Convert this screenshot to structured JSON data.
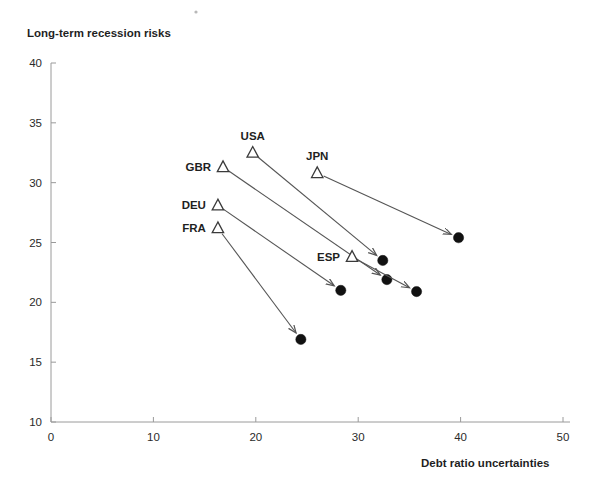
{
  "chart_data": {
    "type": "scatter",
    "title": "",
    "ylabel": "Long-term recession risks",
    "xlabel": "Debt ratio uncertainties",
    "xlim": [
      0,
      50
    ],
    "ylim": [
      10,
      40
    ],
    "xticks": [
      0,
      10,
      20,
      30,
      40,
      50
    ],
    "yticks": [
      10,
      15,
      20,
      25,
      30,
      35,
      40
    ],
    "grid": false,
    "legend": "none",
    "annotation": "Each country has an open-triangle start marker and a filled-circle end marker connected by an arrow pointing from start to end.",
    "series": [
      {
        "name": "GBR",
        "label": "GBR",
        "start": {
          "x": 16.8,
          "y": 31.3,
          "marker": "open-triangle"
        },
        "end": {
          "x": 32.8,
          "y": 21.9,
          "marker": "filled-circle"
        }
      },
      {
        "name": "USA",
        "label": "USA",
        "start": {
          "x": 19.7,
          "y": 32.5,
          "marker": "open-triangle"
        },
        "end": {
          "x": 32.4,
          "y": 23.5,
          "marker": "filled-circle"
        }
      },
      {
        "name": "JPN",
        "label": "JPN",
        "start": {
          "x": 26.0,
          "y": 30.8,
          "marker": "open-triangle"
        },
        "end": {
          "x": 39.8,
          "y": 25.4,
          "marker": "filled-circle"
        }
      },
      {
        "name": "DEU",
        "label": "DEU",
        "start": {
          "x": 16.3,
          "y": 28.1,
          "marker": "open-triangle"
        },
        "end": {
          "x": 28.3,
          "y": 21.0,
          "marker": "filled-circle"
        }
      },
      {
        "name": "FRA",
        "label": "FRA",
        "start": {
          "x": 16.3,
          "y": 26.2,
          "marker": "open-triangle"
        },
        "end": {
          "x": 24.4,
          "y": 16.9,
          "marker": "filled-circle"
        }
      },
      {
        "name": "ESP",
        "label": "ESP",
        "start": {
          "x": 29.4,
          "y": 23.8,
          "marker": "open-triangle"
        },
        "end": {
          "x": 35.7,
          "y": 20.9,
          "marker": "filled-circle"
        }
      }
    ]
  },
  "axes": {
    "y_title": "Long-term recession risks",
    "x_title": "Debt ratio uncertainties",
    "y_tick_labels": [
      "40",
      "35",
      "30",
      "25",
      "20",
      "15",
      "10"
    ],
    "x_tick_labels": [
      "0",
      "10",
      "20",
      "30",
      "40",
      "50"
    ]
  },
  "colors": {
    "marker_fill": "#111111",
    "marker_stroke": "#3a3a3a",
    "arrow": "#555555",
    "axis": "#9a9a9a",
    "text": "#1f1f1f",
    "background": "#ffffff"
  }
}
